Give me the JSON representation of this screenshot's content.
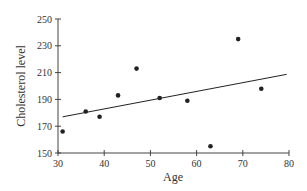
{
  "chart_data": {
    "type": "scatter",
    "title": "",
    "xlabel": "Age",
    "ylabel": "Cholesterol level",
    "xlim": [
      30,
      80
    ],
    "ylim": [
      150,
      250
    ],
    "x_ticks": [
      30,
      40,
      50,
      60,
      70,
      80
    ],
    "y_ticks": [
      150,
      170,
      190,
      210,
      230,
      250
    ],
    "grid": false,
    "legend": null,
    "series": [
      {
        "name": "data",
        "points": [
          {
            "x": 31,
            "y": 166
          },
          {
            "x": 36,
            "y": 181
          },
          {
            "x": 39,
            "y": 177
          },
          {
            "x": 43,
            "y": 193
          },
          {
            "x": 47,
            "y": 213
          },
          {
            "x": 52,
            "y": 191
          },
          {
            "x": 58,
            "y": 189
          },
          {
            "x": 63,
            "y": 155
          },
          {
            "x": 69,
            "y": 235
          },
          {
            "x": 74,
            "y": 198
          }
        ]
      }
    ],
    "trendline": {
      "x1": 31,
      "y1": 177,
      "x2": 79.5,
      "y2": 208.7
    },
    "colors": {
      "points": "#222222",
      "line": "#222222",
      "axis": "#444444"
    }
  }
}
